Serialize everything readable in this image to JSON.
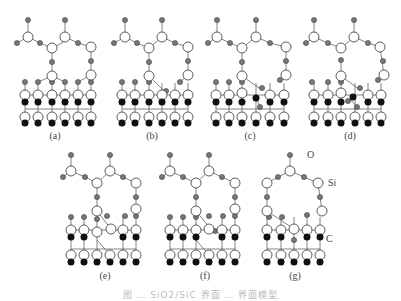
{
  "figure": {
    "panels": [
      {
        "id": "a",
        "label": "(a)"
      },
      {
        "id": "b",
        "label": "(b)"
      },
      {
        "id": "c",
        "label": "(c)"
      },
      {
        "id": "d",
        "label": "(d)"
      },
      {
        "id": "e",
        "label": "(e)"
      },
      {
        "id": "f",
        "label": "(f)"
      },
      {
        "id": "g",
        "label": "(g)"
      }
    ],
    "atom_labels": {
      "oxygen": "O",
      "silicon": "Si",
      "carbon": "C"
    },
    "legend_colors": {
      "oxygen": "#777777",
      "silicon": "#ffffff",
      "carbon": "#111111",
      "bond": "#666666"
    },
    "caption": "图 … SiO2/SiC 界面 … 界面模型"
  }
}
